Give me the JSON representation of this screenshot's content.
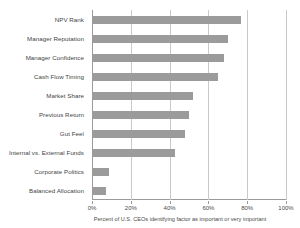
{
  "chart_data": {
    "type": "bar",
    "orientation": "horizontal",
    "title": "",
    "xlabel": "Percent of U.S. CEOs identifying factor as important or very important",
    "ylabel": "",
    "xlim": [
      0,
      100
    ],
    "xticks": [
      "0%",
      "20%",
      "40%",
      "60%",
      "80%",
      "100%"
    ],
    "xtick_values": [
      0,
      20,
      40,
      60,
      80,
      100
    ],
    "grid": true,
    "legend": null,
    "bar_color": "#9b9b9b",
    "categories": [
      "NPV Rank",
      "Manager Reputation",
      "Manager Confidence",
      "Cash Flow Timing",
      "Market Share",
      "Previous Return",
      "Gut Feel",
      "Internal vs. External Funds",
      "Corporate Politics",
      "Balanced Allocation"
    ],
    "values": [
      77,
      70,
      68,
      65,
      52,
      50,
      48,
      43,
      9,
      7
    ]
  }
}
